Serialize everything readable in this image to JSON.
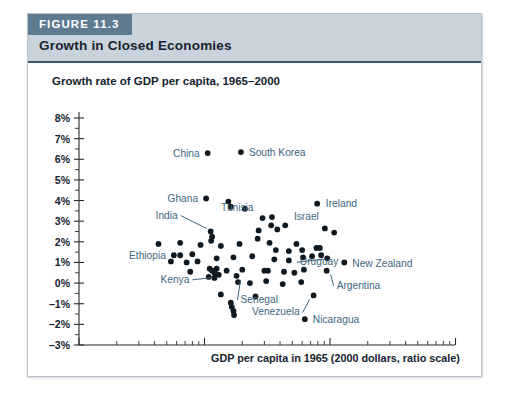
{
  "figure": {
    "badge": "FIGURE 11.3",
    "title": "Growth in Closed Economies"
  },
  "colors": {
    "badge_bg": "#5f7b90",
    "header_bg": "#c8d3dc",
    "header_rule": "#39576e",
    "label_text": "#3d6680",
    "dot": "#101820",
    "frame_border": "#b9c3cb"
  },
  "chart_data": {
    "type": "scatter",
    "title": "Growth in Closed Economies",
    "xlabel": "GDP per capita in 1965 (2000 dollars, ratio scale)",
    "ylabel": "Growth rate of GDP per capita, 1965–2000",
    "x_scale": "log",
    "y_scale": "linear",
    "xlim": [
      100,
      120000
    ],
    "ylim": [
      -3,
      8
    ],
    "x_ticks": [
      {
        "value": 100,
        "label": "100"
      },
      {
        "value": 1000,
        "label": "1,000"
      },
      {
        "value": 10000,
        "label": "10,000"
      },
      {
        "value": 100000,
        "label": "100,000"
      }
    ],
    "y_ticks": [
      {
        "value": 8,
        "label": "8%"
      },
      {
        "value": 7,
        "label": "7%"
      },
      {
        "value": 6,
        "label": "6%"
      },
      {
        "value": 5,
        "label": "5%"
      },
      {
        "value": 4,
        "label": "4%"
      },
      {
        "value": 3,
        "label": "3%"
      },
      {
        "value": 2,
        "label": "2%"
      },
      {
        "value": 1,
        "label": "1%"
      },
      {
        "value": 0,
        "label": "0%"
      },
      {
        "value": -1,
        "label": "–1%"
      },
      {
        "value": -2,
        "label": "–2%"
      },
      {
        "value": -3,
        "label": "–3%"
      }
    ],
    "y_minor_step": 0.5,
    "grid": false,
    "legend": "none",
    "labeled_points": [
      {
        "name": "China",
        "x": 1060,
        "y": 6.3,
        "label_side": "left"
      },
      {
        "name": "South Korea",
        "x": 1950,
        "y": 6.35,
        "label_side": "right"
      },
      {
        "name": "Ghana",
        "x": 1030,
        "y": 4.1,
        "label_side": "left"
      },
      {
        "name": "India",
        "x": 1120,
        "y": 2.45,
        "label_side": "leader"
      },
      {
        "name": "Tunisia",
        "x": 2900,
        "y": 3.15,
        "label_side": "right"
      },
      {
        "name": "Ireland",
        "x": 8000,
        "y": 3.85,
        "label_side": "right"
      },
      {
        "name": "Israel",
        "x": 9100,
        "y": 2.65,
        "label_side": "above"
      },
      {
        "name": "Uruguay",
        "x": 8300,
        "y": 1.35,
        "label_side": "leader"
      },
      {
        "name": "New Zealand",
        "x": 13000,
        "y": 1.0,
        "label_side": "right"
      },
      {
        "name": "Argentina",
        "x": 9400,
        "y": 0.6,
        "label_side": "leader"
      },
      {
        "name": "Ethiopia",
        "x": 570,
        "y": 1.35,
        "label_side": "left"
      },
      {
        "name": "Kenya",
        "x": 1220,
        "y": 0.45,
        "label_side": "leader"
      },
      {
        "name": "Senegal",
        "x": 1800,
        "y": 0.35,
        "label_side": "leader"
      },
      {
        "name": "Venezuela",
        "x": 7400,
        "y": -0.6,
        "label_side": "leader"
      },
      {
        "name": "Nicaragua",
        "x": 6300,
        "y": -1.75,
        "label_side": "right"
      }
    ],
    "points": [
      {
        "x": 1060,
        "y": 6.3
      },
      {
        "x": 1950,
        "y": 6.35
      },
      {
        "x": 1030,
        "y": 4.1
      },
      {
        "x": 1550,
        "y": 3.95
      },
      {
        "x": 1620,
        "y": 3.7
      },
      {
        "x": 2100,
        "y": 3.6
      },
      {
        "x": 7900,
        "y": 3.85
      },
      {
        "x": 3450,
        "y": 3.2
      },
      {
        "x": 3400,
        "y": 2.8
      },
      {
        "x": 2900,
        "y": 3.15
      },
      {
        "x": 1120,
        "y": 2.5
      },
      {
        "x": 1150,
        "y": 2.25
      },
      {
        "x": 1130,
        "y": 2.05
      },
      {
        "x": 2700,
        "y": 2.55
      },
      {
        "x": 2650,
        "y": 2.15
      },
      {
        "x": 3800,
        "y": 2.6
      },
      {
        "x": 4400,
        "y": 2.8
      },
      {
        "x": 9100,
        "y": 2.65
      },
      {
        "x": 10800,
        "y": 2.45
      },
      {
        "x": 430,
        "y": 1.9
      },
      {
        "x": 640,
        "y": 1.95
      },
      {
        "x": 930,
        "y": 1.85
      },
      {
        "x": 1350,
        "y": 1.8
      },
      {
        "x": 1900,
        "y": 1.9
      },
      {
        "x": 3300,
        "y": 1.95
      },
      {
        "x": 3700,
        "y": 1.6
      },
      {
        "x": 4700,
        "y": 1.55
      },
      {
        "x": 5400,
        "y": 1.9
      },
      {
        "x": 6000,
        "y": 1.6
      },
      {
        "x": 7800,
        "y": 1.7
      },
      {
        "x": 8300,
        "y": 1.7
      },
      {
        "x": 570,
        "y": 1.35
      },
      {
        "x": 640,
        "y": 1.35
      },
      {
        "x": 800,
        "y": 1.4
      },
      {
        "x": 880,
        "y": 1.05
      },
      {
        "x": 540,
        "y": 1.05
      },
      {
        "x": 720,
        "y": 1.0
      },
      {
        "x": 1250,
        "y": 1.2
      },
      {
        "x": 1700,
        "y": 1.25
      },
      {
        "x": 2400,
        "y": 1.3
      },
      {
        "x": 3600,
        "y": 1.15
      },
      {
        "x": 4700,
        "y": 1.1
      },
      {
        "x": 6100,
        "y": 1.25
      },
      {
        "x": 7200,
        "y": 1.3
      },
      {
        "x": 8500,
        "y": 1.35
      },
      {
        "x": 9500,
        "y": 1.2
      },
      {
        "x": 13000,
        "y": 1.0
      },
      {
        "x": 770,
        "y": 0.55
      },
      {
        "x": 1100,
        "y": 0.7
      },
      {
        "x": 1150,
        "y": 0.6
      },
      {
        "x": 1200,
        "y": 0.5
      },
      {
        "x": 1250,
        "y": 0.7
      },
      {
        "x": 1300,
        "y": 0.4
      },
      {
        "x": 1220,
        "y": 0.45
      },
      {
        "x": 1080,
        "y": 0.3
      },
      {
        "x": 1200,
        "y": 0.25
      },
      {
        "x": 1500,
        "y": 0.6
      },
      {
        "x": 2000,
        "y": 0.65
      },
      {
        "x": 3000,
        "y": 0.6
      },
      {
        "x": 3200,
        "y": 0.6
      },
      {
        "x": 4300,
        "y": 0.55
      },
      {
        "x": 5200,
        "y": 0.5
      },
      {
        "x": 6200,
        "y": 0.65
      },
      {
        "x": 9400,
        "y": 0.6
      },
      {
        "x": 1850,
        "y": 0.05
      },
      {
        "x": 2300,
        "y": 0.0
      },
      {
        "x": 3100,
        "y": 0.1
      },
      {
        "x": 4200,
        "y": -0.05
      },
      {
        "x": 5900,
        "y": 0.05
      },
      {
        "x": 1350,
        "y": -0.55
      },
      {
        "x": 1800,
        "y": 0.35
      },
      {
        "x": 7400,
        "y": -0.6
      },
      {
        "x": 1620,
        "y": -0.95
      },
      {
        "x": 1650,
        "y": -1.15
      },
      {
        "x": 1700,
        "y": -1.35
      },
      {
        "x": 1720,
        "y": -1.55
      },
      {
        "x": 2550,
        "y": -0.65
      },
      {
        "x": 6300,
        "y": -1.75
      }
    ]
  }
}
